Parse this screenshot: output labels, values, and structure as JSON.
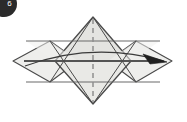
{
  "figure": {
    "domain_label": "origami-fold-diagram",
    "canvas": {
      "width": 187,
      "height": 122,
      "background": "#ffffff"
    },
    "step_badge": {
      "label": "6",
      "shape": "circle",
      "fill": "#2b2b2b",
      "text_color": "#ffffff"
    },
    "palette": {
      "paper_fill": "#e9e9e7",
      "paper_fill_light": "#f2f2f0",
      "paper_fill_mid": "#e2e2df",
      "edge_stroke": "#4a4a4a",
      "heavy_stroke": "#545454",
      "thin_stroke": "#6e6e6e",
      "dash_stroke": "#8c8c8c",
      "arrow_stroke": "#3a3a3a",
      "arrow_fill": "#1f1f1f"
    },
    "geometry": {
      "center_diamond": {
        "top": [
          93,
          17
        ],
        "right": [
          131,
          61
        ],
        "bottom": [
          93,
          104
        ],
        "left": [
          55,
          61
        ]
      },
      "left_diamond": {
        "top": [
          50,
          41
        ],
        "right": [
          78,
          61
        ],
        "bottom": [
          50,
          82
        ],
        "left": [
          13,
          61
        ]
      },
      "right_diamond": {
        "top": [
          136,
          41
        ],
        "right": [
          172,
          61
        ],
        "bottom": [
          136,
          82
        ],
        "left": [
          108,
          61
        ]
      },
      "upper_horizontal_y": 41,
      "center_horizontal_y": 61,
      "lower_horizontal_y": 82,
      "horizontal_x_start": 26,
      "horizontal_x_end": 160
    },
    "elements": [
      {
        "name": "center-diamond",
        "type": "polygon",
        "note": "large central square rotated 45 degrees"
      },
      {
        "name": "left-wing-diamond",
        "type": "polygon",
        "note": "left flap folded outward"
      },
      {
        "name": "right-wing-diamond",
        "type": "polygon",
        "note": "right flap folded outward"
      },
      {
        "name": "upper-horizontal-crease",
        "type": "line"
      },
      {
        "name": "center-horizontal-crease",
        "type": "line",
        "weight": "heavy"
      },
      {
        "name": "lower-horizontal-crease",
        "type": "line"
      },
      {
        "name": "vertical-center-dashed-line",
        "type": "dashed-line"
      },
      {
        "name": "curved-fold-arrow",
        "type": "arc-arrow",
        "direction": "left-to-right"
      }
    ],
    "annotations": {
      "arrow_caption": "",
      "dash_pattern": "5,4"
    }
  }
}
